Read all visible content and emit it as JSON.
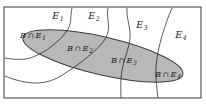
{
  "diagram": {
    "type": "venn-partition",
    "frame": {
      "name": "sample-space-rectangle",
      "x": 4,
      "y": 7,
      "width": 197,
      "height": 91
    },
    "colors": {
      "ellipse_fill": "#b4b4b4",
      "ellipse_stroke": "#3d3d3d",
      "curve_stroke": "#4a4a4a",
      "frame_stroke": "#3a3a3a",
      "background": "#ffffff",
      "text": "#212121"
    },
    "partition_labels": [
      {
        "name": "partition-label-e1",
        "base": "E",
        "sub": "1",
        "x": 58,
        "y": 19
      },
      {
        "name": "partition-label-e2",
        "base": "E",
        "sub": "2",
        "x": 94,
        "y": 19
      },
      {
        "name": "partition-label-e3",
        "base": "E",
        "sub": "3",
        "x": 142,
        "y": 28
      },
      {
        "name": "partition-label-e4",
        "base": "E",
        "sub": "4",
        "x": 181,
        "y": 38
      }
    ],
    "intersection_labels": [
      {
        "name": "intersection-label-b-e1",
        "base": "B",
        "op": "∩",
        "set": "E",
        "sub": "1",
        "x": 33,
        "y": 38
      },
      {
        "name": "intersection-label-b-e2",
        "base": "B",
        "op": "∩",
        "set": "E",
        "sub": "2",
        "x": 80,
        "y": 51
      },
      {
        "name": "intersection-label-b-e3",
        "base": "B",
        "op": "∩",
        "set": "E",
        "sub": "3",
        "x": 124,
        "y": 63
      },
      {
        "name": "intersection-label-b-e4",
        "base": "B",
        "op": "∩",
        "set": "E",
        "sub": "4",
        "x": 168,
        "y": 77
      }
    ],
    "ellipse": {
      "name": "event-b-ellipse",
      "cx": 103,
      "cy": 56,
      "rx": 82,
      "ry": 19,
      "rotation": 13
    },
    "curves": [
      {
        "name": "partition-curve-1",
        "d": "M 72 8 C 70 16, 72 22, 68 29 C 64 36, 58 41, 52 46 C 46 51, 40 54, 33 57 C 26 60, 16 60, 5 58"
      },
      {
        "name": "partition-curve-2",
        "d": "M 108 8 C 106 17, 110 24, 108 32 C 106 41, 98 48, 90 55 C 82 62, 73 68, 64 74 C 55 80, 46 83, 36 83 C 26 83, 14 80, 5 76"
      },
      {
        "name": "partition-curve-3",
        "d": "M 127 8 C 126 18, 131 28, 130 38 C 129 49, 124 59, 122 70 C 120 81, 121 90, 121 98"
      },
      {
        "name": "partition-curve-4",
        "d": "M 172 8 C 168 17, 165 26, 162 36 C 159 46, 157 56, 156 66 C 155 76, 157 88, 158 98"
      }
    ]
  }
}
